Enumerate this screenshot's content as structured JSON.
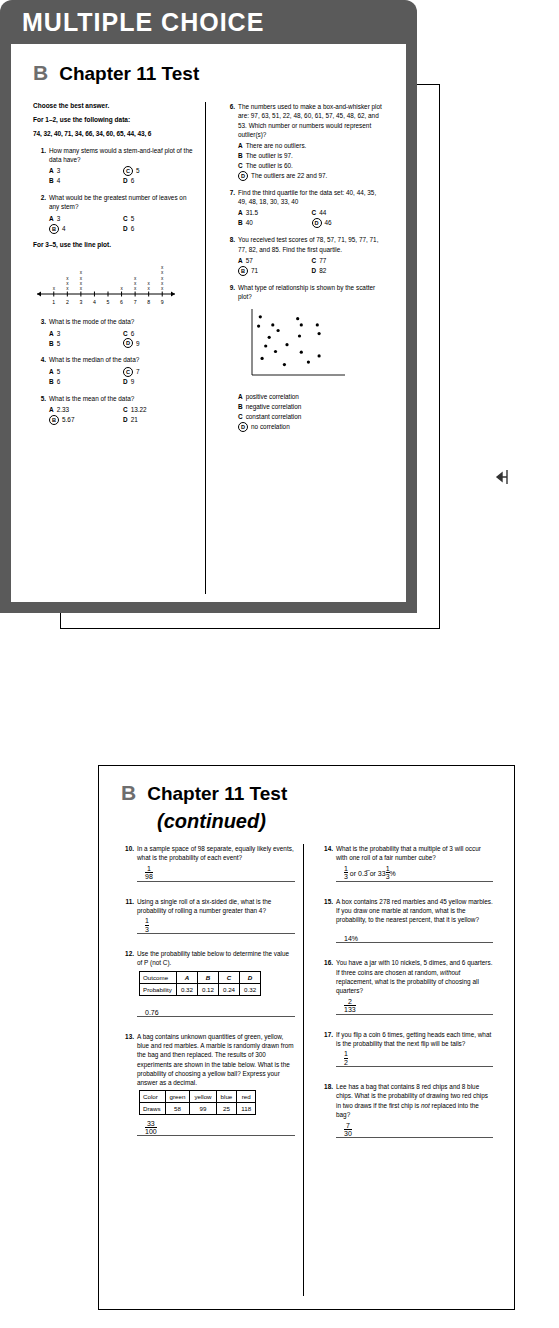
{
  "sheets": {
    "a": {
      "letter": "A",
      "title": "Chapter 11 Test"
    },
    "c": {
      "letter": "C",
      "title": "Chapter 11 Test"
    },
    "b1": {
      "letter": "B",
      "title": "Chapter 11 Test",
      "banner": "MULTIPLE CHOICE"
    },
    "b2": {
      "letter": "B",
      "title": "Chapter 11 Test",
      "continued": "(continued)"
    }
  },
  "page1": {
    "instructions": [
      "Choose the best answer.",
      "For 1–2, use the following data:"
    ],
    "data_list": "74, 32, 40, 71, 34, 66, 34, 60, 65, 44, 43, 6",
    "lineplot_instruction": "For 3–5, use the line plot.",
    "questions": [
      {
        "num": "1.",
        "text": "How many stems would a stem-and-leaf plot of the data have?",
        "choices": [
          {
            "label": "A",
            "text": "3",
            "selected": false
          },
          {
            "label": "C",
            "text": "5",
            "selected": true
          },
          {
            "label": "B",
            "text": "4",
            "selected": false
          },
          {
            "label": "D",
            "text": "6",
            "selected": false
          }
        ]
      },
      {
        "num": "2.",
        "text": "What would be the greatest number of leaves on any stem?",
        "choices": [
          {
            "label": "A",
            "text": "3",
            "selected": false
          },
          {
            "label": "C",
            "text": "5",
            "selected": false
          },
          {
            "label": "B",
            "text": "4",
            "selected": true
          },
          {
            "label": "D",
            "text": "6",
            "selected": false
          }
        ]
      },
      {
        "num": "3.",
        "text": "What is the mode of the data?",
        "choices": [
          {
            "label": "A",
            "text": "3",
            "selected": false
          },
          {
            "label": "C",
            "text": "6",
            "selected": false
          },
          {
            "label": "B",
            "text": "5",
            "selected": false
          },
          {
            "label": "D",
            "text": "9",
            "selected": true
          }
        ]
      },
      {
        "num": "4.",
        "text": "What is the median of the data?",
        "choices": [
          {
            "label": "A",
            "text": "5",
            "selected": false
          },
          {
            "label": "C",
            "text": "7",
            "selected": true
          },
          {
            "label": "B",
            "text": "6",
            "selected": false
          },
          {
            "label": "D",
            "text": "9",
            "selected": false
          }
        ]
      },
      {
        "num": "5.",
        "text": "What is the mean of the data?",
        "choices": [
          {
            "label": "A",
            "text": "2.33",
            "selected": false
          },
          {
            "label": "C",
            "text": "13.22",
            "selected": false
          },
          {
            "label": "B",
            "text": "5.67",
            "selected": true
          },
          {
            "label": "D",
            "text": "21",
            "selected": false
          }
        ]
      },
      {
        "num": "6.",
        "text": "The numbers used to make a box-and-whisker plot are: 97, 63, 51, 22, 48, 60, 61, 57, 45, 48, 62, and 53. Which number or numbers would represent outlier(s)?",
        "choices": [
          {
            "label": "A",
            "text": "There are no outliers.",
            "selected": false,
            "full": true
          },
          {
            "label": "B",
            "text": "The outlier is 97.",
            "selected": false,
            "full": true
          },
          {
            "label": "C",
            "text": "The outlier is 60.",
            "selected": false,
            "full": true
          },
          {
            "label": "D",
            "text": "The outliers are 22 and 97.",
            "selected": true,
            "full": true
          }
        ]
      },
      {
        "num": "7.",
        "text": "Find the third quartile for the data set: 40, 44, 35, 49, 48, 18, 30, 33, 40",
        "choices": [
          {
            "label": "A",
            "text": "31.5",
            "selected": false
          },
          {
            "label": "C",
            "text": "44",
            "selected": false
          },
          {
            "label": "B",
            "text": "40",
            "selected": false
          },
          {
            "label": "D",
            "text": "46",
            "selected": true
          }
        ]
      },
      {
        "num": "8.",
        "text": "You received test scores of 78, 57, 71, 95, 77, 71, 77, 82, and 85. Find the first quartile.",
        "choices": [
          {
            "label": "A",
            "text": "57",
            "selected": false
          },
          {
            "label": "C",
            "text": "77",
            "selected": false
          },
          {
            "label": "B",
            "text": "71",
            "selected": true
          },
          {
            "label": "D",
            "text": "82",
            "selected": false
          }
        ]
      },
      {
        "num": "9.",
        "text": "What type of relationship is shown by the scatter plot?",
        "choices": [
          {
            "label": "A",
            "text": "positive correlation",
            "selected": false,
            "full": true
          },
          {
            "label": "B",
            "text": "negative correlation",
            "selected": false,
            "full": true
          },
          {
            "label": "C",
            "text": "constant correlation",
            "selected": false,
            "full": true
          },
          {
            "label": "D",
            "text": "no correlation",
            "selected": true,
            "full": true
          }
        ]
      }
    ]
  },
  "chart_data": [
    {
      "type": "bar",
      "name": "line-plot",
      "title": "",
      "xlabel": "",
      "ylabel": "frequency",
      "categories": [
        "1",
        "2",
        "3",
        "4",
        "5",
        "6",
        "7",
        "8",
        "9"
      ],
      "values": [
        1,
        3,
        4,
        0,
        0,
        1,
        3,
        2,
        5
      ],
      "marker": "x",
      "axis": "number line with arrows at both ends",
      "grid": false,
      "legend": "none"
    },
    {
      "type": "scatter",
      "name": "scatter-plot-q9",
      "title": "",
      "xlabel": "",
      "ylabel": "",
      "xlim": [
        0,
        10
      ],
      "ylim": [
        0,
        10
      ],
      "grid": false,
      "legend": "none",
      "points": [
        [
          0.6,
          8.9
        ],
        [
          0.4,
          7.4
        ],
        [
          2.0,
          7.6
        ],
        [
          2.6,
          6.7
        ],
        [
          1.6,
          5.6
        ],
        [
          1.2,
          4.2
        ],
        [
          0.8,
          2.2
        ],
        [
          2.3,
          3.3
        ],
        [
          3.3,
          1.2
        ],
        [
          3.6,
          4.4
        ],
        [
          4.8,
          8.6
        ],
        [
          5.2,
          7.6
        ],
        [
          5.0,
          5.8
        ],
        [
          5.2,
          3.2
        ],
        [
          6.0,
          1.6
        ],
        [
          7.0,
          7.6
        ],
        [
          7.2,
          6.2
        ],
        [
          7.2,
          2.6
        ]
      ]
    }
  ],
  "page2": {
    "questions": [
      {
        "num": "10.",
        "text": "In a sample space of 98 separate, equally likely events, what is the probability of each event?",
        "answer": {
          "type": "fraction",
          "numerator": "1",
          "denominator": "98"
        }
      },
      {
        "num": "11.",
        "text": "Using a single roll of a six-sided die, what is the probability of rolling a number greater than 4?",
        "answer": {
          "type": "fraction",
          "numerator": "1",
          "denominator": "3"
        }
      },
      {
        "num": "12.",
        "text": "Use the probability table below to determine the value of P (not C).",
        "table": {
          "rows": [
            {
              "header": "Outcome",
              "cells": [
                "A",
                "B",
                "C",
                "D"
              ],
              "italic": true
            },
            {
              "header": "Probability",
              "cells": [
                "0.32",
                "0.12",
                "0.24",
                "0.32"
              ],
              "italic": false
            }
          ]
        },
        "answer": {
          "type": "plain",
          "value": "0.76"
        }
      },
      {
        "num": "13.",
        "text": "A bag contains unknown quantities of green, yellow, blue and red marbles. A marble is randomly drawn from the bag and then replaced. The results of 300 experiments are shown in the table below. What is the probability of choosing a yellow ball? Express your answer as a decimal.",
        "table": {
          "rows": [
            {
              "header": "Color",
              "cells": [
                "green",
                "yellow",
                "blue",
                "red"
              ],
              "italic": false
            },
            {
              "header": "Draws",
              "cells": [
                "58",
                "99",
                "25",
                "118"
              ],
              "italic": false
            }
          ]
        },
        "answer": {
          "type": "fraction",
          "numerator": "33",
          "denominator": "100"
        }
      },
      {
        "num": "14.",
        "text": "What is the probability that a multiple of 3 will occur with one roll of a fair number cube?",
        "answer": {
          "type": "mixed",
          "value": "1/3 or 0.3̅ or 33 1/3%",
          "f1n": "1",
          "f1d": "3",
          "mid1": " or 0.3̅ or 33",
          "f2n": "1",
          "f2d": "3",
          "suffix": "%"
        }
      },
      {
        "num": "15.",
        "text": "A box contains 278 red marbles and 45 yellow marbles. If you draw one marble at random, what is the probability, to the nearest percent, that it is yellow?",
        "answer": {
          "type": "plain",
          "value": "14%"
        }
      },
      {
        "num": "16.",
        "text": "You have a jar with 10 nickels, 5 dimes, and 6 quarters. If three coins are chosen at random, without replacement, what is the probability of choosing all quarters?",
        "italic_word": "without",
        "answer": {
          "type": "fraction",
          "numerator": "2",
          "denominator": "133"
        }
      },
      {
        "num": "17.",
        "text": "If you flip a coin 6 times, getting heads each time, what is the probability that the next flip will be tails?",
        "answer": {
          "type": "fraction",
          "numerator": "1",
          "denominator": "2"
        }
      },
      {
        "num": "18.",
        "text": "Lee has a bag that contains 8 red chips and 8 blue chips. What is the probability of drawing two red chips in two draws if the first chip is not replaced into the bag?",
        "italic_word": "not",
        "answer": {
          "type": "fraction",
          "numerator": "7",
          "denominator": "30"
        }
      }
    ]
  },
  "colors": {
    "banner_bg": "#5a5a5a",
    "letter_gray": "#6e6e6e",
    "ink": "#000000",
    "rule": "#555555"
  },
  "edge_marker": "left-arrow-marker"
}
